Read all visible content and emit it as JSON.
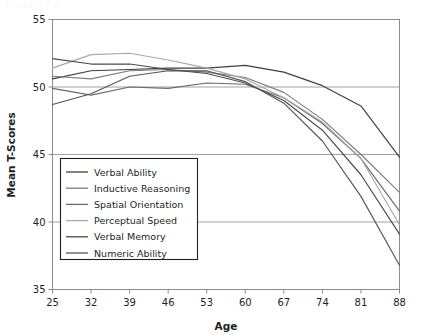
{
  "page": {
    "faint_header": "FIGURE 7.4"
  },
  "chart_data": {
    "type": "line",
    "title": "",
    "xlabel": "Age",
    "ylabel": "Mean T-Scores",
    "x": [
      25,
      32,
      39,
      46,
      53,
      60,
      67,
      74,
      81,
      88
    ],
    "categories": [
      "25",
      "32",
      "39",
      "46",
      "53",
      "60",
      "67",
      "74",
      "81",
      "88"
    ],
    "xlim": [
      25,
      88
    ],
    "ylim": [
      35,
      55
    ],
    "yticks": [
      35,
      40,
      45,
      50,
      55
    ],
    "ytick_labels": [
      "35",
      "40",
      "45",
      "50",
      "55"
    ],
    "xticks": [
      25,
      32,
      39,
      46,
      53,
      60,
      67,
      74,
      81,
      88
    ],
    "grid": "horizontal",
    "legend_position": "inside-lower-left",
    "series": [
      {
        "name": "Verbal Ability",
        "color": "#3f3f3f",
        "values": [
          50.6,
          51.2,
          51.3,
          51.4,
          51.4,
          51.6,
          51.1,
          50.1,
          48.6,
          44.8
        ]
      },
      {
        "name": "Inductive Reasoning",
        "color": "#7d7d7d",
        "values": [
          50.8,
          50.6,
          51.2,
          51.3,
          51.1,
          50.7,
          49.6,
          47.6,
          45.0,
          42.2
        ]
      },
      {
        "name": "Spatial Orientation",
        "color": "#6a6a6a",
        "values": [
          49.9,
          49.4,
          50.0,
          49.9,
          50.3,
          50.2,
          49.2,
          47.3,
          44.7,
          40.8
        ]
      },
      {
        "name": "Perceptual Speed",
        "color": "#a8a8a8",
        "values": [
          51.4,
          52.4,
          52.5,
          52.0,
          51.4,
          50.6,
          49.2,
          47.4,
          44.7,
          39.8
        ]
      },
      {
        "name": "Verbal Memory",
        "color": "#4b4b4b",
        "values": [
          52.1,
          51.7,
          51.7,
          51.3,
          51.0,
          50.3,
          49.0,
          46.8,
          43.5,
          39.1
        ]
      },
      {
        "name": "Numeric Ability",
        "color": "#555555",
        "values": [
          48.7,
          49.5,
          50.8,
          51.2,
          51.2,
          50.4,
          48.8,
          46.0,
          41.9,
          36.8
        ]
      }
    ]
  }
}
